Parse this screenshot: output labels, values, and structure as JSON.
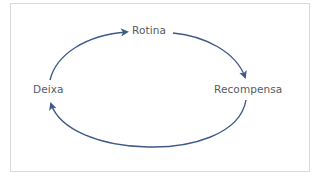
{
  "diagram": {
    "type": "cycle",
    "nodes": [
      {
        "id": "rotina",
        "label": "Rotina"
      },
      {
        "id": "recompensa",
        "label": "Recompensa"
      },
      {
        "id": "deixa",
        "label": "Deixa"
      }
    ],
    "edges": [
      {
        "from": "deixa",
        "to": "rotina"
      },
      {
        "from": "rotina",
        "to": "recompensa"
      },
      {
        "from": "recompensa",
        "to": "deixa"
      }
    ],
    "colors": {
      "arrow": "#3f5a86",
      "text": "#555b62",
      "border": "#d9d9d9"
    }
  }
}
